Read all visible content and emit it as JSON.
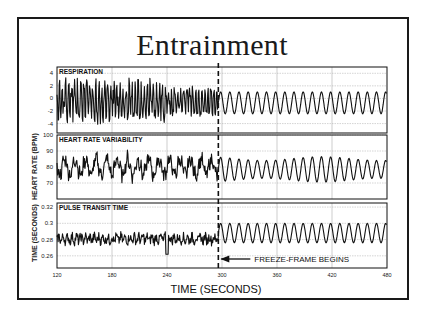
{
  "title": "Entrainment",
  "xaxis": {
    "label": "TIME (SECONDS)",
    "ticks": [
      120,
      180,
      240,
      300,
      360,
      420,
      480
    ],
    "range": [
      120,
      480
    ]
  },
  "annotation": {
    "label": "FREEZE-FRAME BEGINS",
    "time": 296
  },
  "panels": [
    {
      "title": "RESPIRATION",
      "ylabel": "",
      "yticks": [
        "4",
        "2",
        "0",
        "-2",
        "-4"
      ]
    },
    {
      "title": "HEART RATE VARIABILITY",
      "ylabel": "HEART RATE (BPM)",
      "yticks": [
        "100",
        "90",
        "80",
        "70"
      ]
    },
    {
      "title": "PULSE TRANSIT TIME",
      "ylabel": "TIME (SECONDS)",
      "yticks": [
        "0.32",
        "0.3",
        "0.28",
        "0.26"
      ]
    }
  ],
  "chart_data": {
    "type": "line",
    "title": "Entrainment",
    "xlabel": "TIME (SECONDS)",
    "x_range": [
      120,
      480
    ],
    "x_ticks": [
      120,
      180,
      240,
      300,
      360,
      420,
      480
    ],
    "grid": true,
    "annotations": [
      {
        "x": 296,
        "text": "FREEZE-FRAME BEGINS",
        "style": "dashed vertical line with left arrow"
      }
    ],
    "series": [
      {
        "name": "RESPIRATION",
        "ylabel": "",
        "ylim": [
          -5.5,
          5
        ],
        "yticks": [
          4,
          2,
          0,
          -2,
          -4
        ],
        "description": "Irregular high-amplitude oscillation (about -4.5 to 3.5) from 120-240 s, moderately irregular 240-296 s, then regular sinusoidal oscillation ~-2.5 to 1 with ~10 s period after 296 s",
        "pre_freeze_amplitude": 4,
        "post_freeze_range": [
          -2.5,
          1
        ],
        "post_freeze_period_s": 10
      },
      {
        "name": "HEART RATE VARIABILITY",
        "ylabel": "HEART RATE (BPM)",
        "ylim": [
          60,
          100
        ],
        "yticks": [
          100,
          90,
          80,
          70
        ],
        "description": "Irregular fluctuation 68-90 BPM before 296 s; regular oscillation ~70-87 BPM with ~10 s period after",
        "pre_freeze_range": [
          68,
          90
        ],
        "post_freeze_range": [
          70,
          87
        ],
        "post_freeze_period_s": 10
      },
      {
        "name": "PULSE TRANSIT TIME",
        "ylabel": "TIME (SECONDS)",
        "ylim": [
          0.245,
          0.325
        ],
        "yticks": [
          0.32,
          0.3,
          0.28,
          0.26
        ],
        "description": "Noisy signal ~0.27-0.29 s before 296 s (dip to ~0.26 near 240 s); regular oscillation ~0.275-0.30 s with ~10 s period after",
        "pre_freeze_range": [
          0.265,
          0.295
        ],
        "post_freeze_range": [
          0.275,
          0.301
        ],
        "post_freeze_period_s": 10
      }
    ]
  }
}
